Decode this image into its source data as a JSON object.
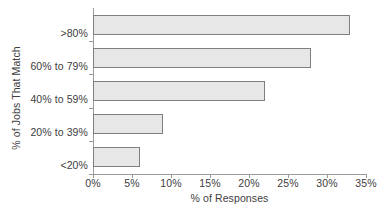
{
  "chart_data": {
    "type": "bar",
    "orientation": "horizontal",
    "title": "",
    "xlabel": "% of Responses",
    "ylabel": "% of Jobs That Match",
    "categories": [
      "<20%",
      "20% to 39%",
      "40% to 59%",
      "60% to 79%",
      ">80%"
    ],
    "values": [
      6,
      9,
      22,
      28,
      33
    ],
    "xlim": [
      0,
      35
    ],
    "xticks": [
      0,
      5,
      10,
      15,
      20,
      25,
      30,
      35
    ],
    "xtick_labels": [
      "0%",
      "5%",
      "10%",
      "15%",
      "20%",
      "25%",
      "30%",
      "35%"
    ],
    "grid": false,
    "legend": false,
    "series": [
      {
        "name": "% of Responses",
        "values": [
          6,
          9,
          22,
          28,
          33
        ]
      }
    ],
    "colors": {
      "bar_fill": "#e7e7e7",
      "bar_border": "#7f7f7f",
      "axis": "#9a9a9a",
      "text": "#404040",
      "background": "#ffffff"
    }
  },
  "clipped_caption": ""
}
